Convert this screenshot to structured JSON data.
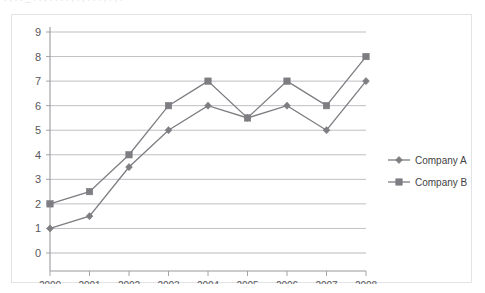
{
  "page_bleed_text": ". , . . _ . . , . . . . , . , . . . , . , .",
  "chart_data": {
    "type": "line",
    "title": "",
    "subtitle": "",
    "xlabel": "",
    "ylabel": "",
    "x": [
      "2000",
      "2001",
      "2002",
      "2003",
      "2004",
      "2005",
      "2006",
      "2007",
      "2008"
    ],
    "categories": [
      "2000",
      "2001",
      "2002",
      "2003",
      "2004",
      "2005",
      "2006",
      "2007",
      "2008"
    ],
    "series": [
      {
        "name": "Company A",
        "marker": "diamond",
        "color": "#7d7d82",
        "values": [
          1,
          1.5,
          3.5,
          5,
          6,
          5.5,
          6,
          5,
          7
        ]
      },
      {
        "name": "Company B",
        "marker": "square",
        "color": "#7d7d82",
        "values": [
          2,
          2.5,
          4,
          6,
          7,
          5.5,
          7,
          6,
          8
        ]
      }
    ],
    "ylim": [
      0,
      9
    ],
    "yticks": [
      0,
      1,
      2,
      3,
      4,
      5,
      6,
      7,
      8,
      9
    ],
    "ytick_labels": [
      "0",
      "1",
      "2",
      "3",
      "4",
      "5",
      "6",
      "7",
      "8",
      "9"
    ],
    "grid": true,
    "grid_axis": "y",
    "grid_color": "#b8b8bd",
    "legend_position": "right",
    "legend_entries": [
      "Company A",
      "Company B"
    ],
    "axis_color": "#9a9a9f",
    "background": "#ffffff",
    "border_color": "#e3e3e6"
  }
}
